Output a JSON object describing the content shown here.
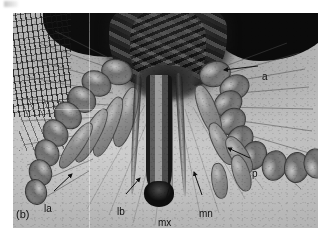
{
  "figure": {
    "panel_id": "(b)",
    "type": "light micrograph",
    "background_color": "#ffffff",
    "plate_color": "#b9b9b9"
  },
  "annotations": [
    {
      "key": "a",
      "label": "a",
      "meaning": "antenna",
      "label_x": 262,
      "label_y": 64,
      "leader": {
        "x1": 258,
        "y1": 66,
        "x2": 224,
        "y2": 70,
        "arrow": true
      }
    },
    {
      "key": "p",
      "label": "p",
      "meaning": "palp",
      "label_x": 252,
      "label_y": 161,
      "leader": {
        "x1": 250,
        "y1": 158,
        "x2": 228,
        "y2": 148,
        "arrow": true
      }
    },
    {
      "key": "la",
      "label": "la",
      "meaning": "labrum",
      "label_x": 44,
      "label_y": 196,
      "leader": {
        "x1": 54,
        "y1": 191,
        "x2": 72,
        "y2": 174,
        "arrow": true
      }
    },
    {
      "key": "lb",
      "label": "lb",
      "meaning": "labium",
      "label_x": 117,
      "label_y": 199,
      "leader": {
        "x1": 126,
        "y1": 194,
        "x2": 140,
        "y2": 178,
        "arrow": true
      }
    },
    {
      "key": "mx",
      "label": "mx",
      "meaning": "maxilla",
      "label_x": 158,
      "label_y": 213,
      "leader": {
        "x1": 164,
        "y1": 206,
        "x2": 170,
        "y2": 186,
        "arrow": false
      }
    },
    {
      "key": "mn",
      "label": "mn",
      "meaning": "mandible",
      "label_x": 199,
      "label_y": 201,
      "leader": {
        "x1": 202,
        "y1": 195,
        "x2": 194,
        "y2": 172,
        "arrow": true
      }
    }
  ],
  "chart_data": {
    "type": "table",
    "categories": [
      "a",
      "p",
      "la",
      "lb",
      "mx",
      "mn"
    ],
    "values": [
      "antenna",
      "palp",
      "labrum",
      "labium",
      "maxilla",
      "mandible"
    ]
  }
}
